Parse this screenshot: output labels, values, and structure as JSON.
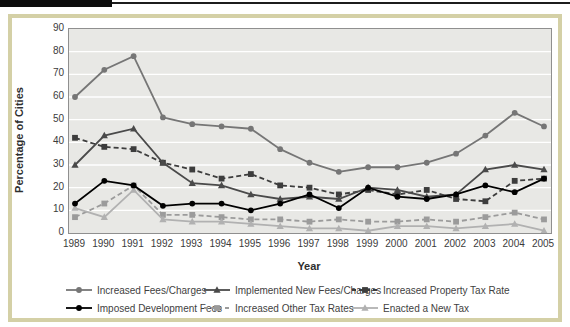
{
  "header": {
    "accent_bar_color": "#0d0d0d"
  },
  "palette": {
    "frame_border": "#d4d0a6",
    "plot_background": "#e8e8e5",
    "gridline": "#ffffff",
    "axis_text": "#3b3b3b"
  },
  "chart_data": {
    "type": "line",
    "title": "",
    "xlabel": "Year",
    "ylabel": "Percentage of Cities",
    "ylim": [
      0,
      90
    ],
    "ytick_step": 10,
    "grid": "horizontal",
    "legend_position": "bottom",
    "categories": [
      1989,
      1990,
      1991,
      1992,
      1993,
      1994,
      1995,
      1996,
      1997,
      1998,
      1999,
      2000,
      2001,
      2002,
      2003,
      2004,
      2005
    ],
    "series": [
      {
        "name": "Increased Fees/Charges",
        "marker": "circle",
        "dash": false,
        "color": "#767676",
        "values": [
          60,
          72,
          78,
          51,
          48,
          47,
          46,
          37,
          31,
          27,
          29,
          29,
          31,
          35,
          43,
          53,
          47
        ]
      },
      {
        "name": "Implemented New Fees/Charges",
        "marker": "triangle",
        "dash": false,
        "color": "#4a4a4a",
        "values": [
          30,
          43,
          46,
          31,
          22,
          21,
          17,
          15,
          16,
          15,
          20,
          19,
          16,
          17,
          28,
          30,
          28
        ]
      },
      {
        "name": "Increased Property Tax Rate",
        "marker": "square",
        "dash": true,
        "color": "#3d3d3d",
        "values": [
          42,
          38,
          37,
          31,
          28,
          24,
          26,
          21,
          20,
          17,
          19,
          17,
          19,
          15,
          14,
          23,
          24
        ]
      },
      {
        "name": "Imposed Development Fees",
        "marker": "circle",
        "dash": false,
        "color": "#000000",
        "values": [
          13,
          23,
          21,
          12,
          13,
          13,
          10,
          13,
          17,
          11,
          20,
          16,
          15,
          17,
          21,
          18,
          24
        ]
      },
      {
        "name": "Increased Other Tax Rates",
        "marker": "square",
        "dash": true,
        "color": "#9b9b9b",
        "values": [
          7,
          13,
          21,
          8,
          8,
          7,
          6,
          6,
          5,
          6,
          5,
          5,
          6,
          5,
          7,
          9,
          6
        ]
      },
      {
        "name": "Enacted a New Tax",
        "marker": "triangle",
        "dash": false,
        "color": "#b1b1b1",
        "values": [
          11,
          7,
          19,
          6,
          5,
          5,
          4,
          3,
          2,
          2,
          1,
          3,
          3,
          2,
          3,
          4,
          1
        ]
      }
    ],
    "legend_rows": [
      [
        0,
        1,
        2
      ],
      [
        3,
        4,
        5
      ]
    ]
  }
}
